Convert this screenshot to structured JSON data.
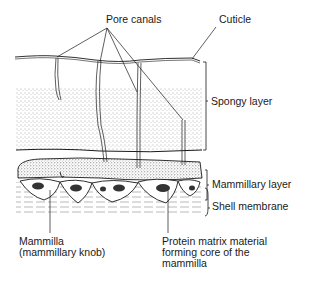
{
  "diagram": {
    "labels": {
      "pore_canals": "Pore canals",
      "cuticle": "Cuticle",
      "spongy_layer": "Spongy layer",
      "mammillary_layer": "Mammillary layer",
      "shell_membrane": "Shell membrane",
      "mammilla_line1": "Mammilla",
      "mammilla_line2": "(mammillary knob)",
      "protein_line1": "Protein matrix material",
      "protein_line2": "forming core of the",
      "protein_line3": "mammilla"
    },
    "colors": {
      "ink": "#1a1a1a",
      "stipple": "#555555",
      "background": "#ffffff"
    }
  }
}
